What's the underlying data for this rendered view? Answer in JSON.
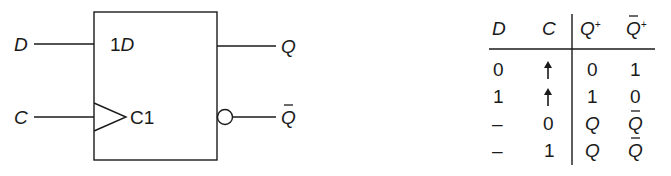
{
  "symbol": {
    "title": "D flip-flop (IEC symbol)",
    "inputs": [
      {
        "label": "D",
        "pin_label_prefix": "1",
        "pin_label_main": "D"
      },
      {
        "label": "C",
        "pin_label": "C1",
        "clock_indicator": "dynamic-input-triangle"
      }
    ],
    "outputs": [
      {
        "label": "Q",
        "inverted": false
      },
      {
        "label": "Q",
        "overbar": true,
        "inverted": true,
        "negation_indicator": "circle"
      }
    ]
  },
  "truth_table": {
    "headers": [
      {
        "text": "D",
        "italic": true
      },
      {
        "text": "C",
        "italic": true
      },
      {
        "text": "Q",
        "sup": "+",
        "italic": true
      },
      {
        "text": "Q",
        "sup": "+",
        "italic": true,
        "overbar": true
      }
    ],
    "rows": [
      [
        "0",
        "↑",
        "0",
        "1"
      ],
      [
        "1",
        "↑",
        "1",
        "0"
      ],
      [
        "–",
        "0",
        "Q",
        "Q̄"
      ],
      [
        "–",
        "1",
        "Q",
        "Q̄"
      ]
    ]
  },
  "colors": {
    "ink": "#1a1a1a",
    "background": "#ffffff"
  }
}
